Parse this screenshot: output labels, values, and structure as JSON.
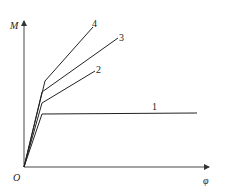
{
  "diagram": {
    "title": "",
    "axes": {
      "x_label": "φ",
      "y_label": "M",
      "origin_label": "O"
    },
    "curves": [
      {
        "label": "1",
        "points": [
          [
            24,
            167
          ],
          [
            42,
            114
          ],
          [
            197,
            113
          ]
        ],
        "label_pos": [
          155,
          110
        ]
      },
      {
        "label": "2",
        "points": [
          [
            24,
            167
          ],
          [
            42,
            103
          ],
          [
            95,
            71
          ]
        ],
        "label_pos": [
          98,
          73
        ]
      },
      {
        "label": "3",
        "points": [
          [
            24,
            167
          ],
          [
            42,
            92
          ],
          [
            118,
            38
          ]
        ],
        "label_pos": [
          121,
          40
        ]
      },
      {
        "label": "4",
        "points": [
          [
            24,
            167
          ],
          [
            45,
            81
          ],
          [
            93,
            27
          ]
        ],
        "label_pos": [
          94,
          26
        ]
      }
    ],
    "colors": {
      "line": "#222222",
      "axis": "#333333",
      "background": "#ffffff"
    }
  }
}
